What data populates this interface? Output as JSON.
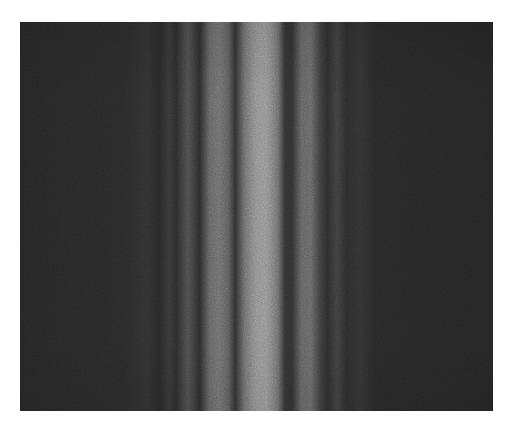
{
  "image": {
    "subject": "diffraction fringe pattern",
    "description": "Grayscale photograph of vertical interference/diffraction fringes: a bright central band flanked by alternating dark and dimmer bright bands, fading into a dark noisy background.",
    "frame": {
      "x": 20,
      "y": 22,
      "width": 473,
      "height": 389
    },
    "colors": {
      "page_background": "#ffffff",
      "background": "#262626",
      "central_band": "#8c8c8c",
      "secondary_band": "#6a6a6a",
      "tertiary_band": "#444444",
      "dark_minimum": "#2a2a2a"
    },
    "bands": [
      {
        "type": "faint-bright",
        "center_x": 168,
        "width": 12
      },
      {
        "type": "dark",
        "center_x": 183,
        "width": 8
      },
      {
        "type": "secondary-bright",
        "center_x": 206,
        "width": 22
      },
      {
        "type": "dark",
        "center_x": 223,
        "width": 10
      },
      {
        "type": "central-bright",
        "center_x": 248,
        "width": 30
      },
      {
        "type": "dark",
        "center_x": 272,
        "width": 10
      },
      {
        "type": "secondary-bright",
        "center_x": 288,
        "width": 18
      },
      {
        "type": "dark",
        "center_x": 306,
        "width": 10
      },
      {
        "type": "faint-bright",
        "center_x": 322,
        "width": 12
      }
    ]
  }
}
